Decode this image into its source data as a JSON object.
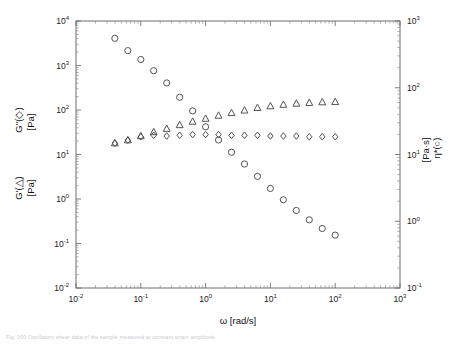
{
  "figure": {
    "caption": "Fig. 000  Oscillatory shear data of the sample measured at constant strain amplitude."
  },
  "colors": {
    "frame": "#6f6f6f",
    "marker": "#4a4a4a",
    "text": "#111111"
  },
  "chart_data": {
    "type": "scatter",
    "title": "",
    "xlabel": "ω [rad/s]",
    "xscale": "log",
    "xlim": [
      0.01,
      1000
    ],
    "xticks": [
      "10-2",
      "10-1",
      "100",
      "101",
      "102",
      "103"
    ],
    "xtick_labels": [
      "10",
      "10",
      "10",
      "10",
      "10",
      "10"
    ],
    "xtick_exponents": [
      "-2",
      "-1",
      "0",
      "1",
      "2",
      "3"
    ],
    "ylabel_left_line1": "G''(◇)",
    "ylabel_left_line2": "[Pa]",
    "ylabel_left_line3": "G'(△)",
    "ylabel_left_line4": "[Pa]",
    "yscale_left": "log",
    "ylim_left": [
      0.01,
      10000
    ],
    "ytick_left_exponents": [
      "-2",
      "-1",
      "0",
      "1",
      "2",
      "3",
      "4"
    ],
    "ylabel_right_line1": "η*(○)",
    "ylabel_right_line2": "[Pa·s]",
    "yscale_right": "log",
    "ylim_right": [
      0.1,
      1000
    ],
    "ytick_right_exponents": [
      "-1",
      "0",
      "1",
      "2",
      "3"
    ],
    "grid": false,
    "legend": "inline-in-axis-labels",
    "series": [
      {
        "name": "η*(○)",
        "marker": "circle",
        "axis": "right",
        "unit": "Pa·s",
        "points": [
          {
            "x": 0.0398,
            "y": 550
          },
          {
            "x": 0.0631,
            "y": 360
          },
          {
            "x": 0.1,
            "y": 265
          },
          {
            "x": 0.158,
            "y": 180
          },
          {
            "x": 0.251,
            "y": 118
          },
          {
            "x": 0.398,
            "y": 72
          },
          {
            "x": 0.631,
            "y": 45
          },
          {
            "x": 1.0,
            "y": 26
          },
          {
            "x": 1.585,
            "y": 16.5
          },
          {
            "x": 2.512,
            "y": 10.8
          },
          {
            "x": 3.98,
            "y": 7.2
          },
          {
            "x": 6.31,
            "y": 4.7
          },
          {
            "x": 10.0,
            "y": 3.1
          },
          {
            "x": 15.85,
            "y": 2.1
          },
          {
            "x": 25.12,
            "y": 1.45
          },
          {
            "x": 39.8,
            "y": 1.05
          },
          {
            "x": 63.1,
            "y": 0.78
          },
          {
            "x": 100.0,
            "y": 0.62
          }
        ]
      },
      {
        "name": "G'(△)",
        "marker": "triangle",
        "axis": "left",
        "unit": "Pa",
        "points": [
          {
            "x": 0.0398,
            "y": 18
          },
          {
            "x": 0.0631,
            "y": 21
          },
          {
            "x": 0.1,
            "y": 26
          },
          {
            "x": 0.158,
            "y": 32
          },
          {
            "x": 0.251,
            "y": 38
          },
          {
            "x": 0.398,
            "y": 46
          },
          {
            "x": 0.631,
            "y": 55
          },
          {
            "x": 1.0,
            "y": 64
          },
          {
            "x": 1.585,
            "y": 75
          },
          {
            "x": 2.512,
            "y": 86
          },
          {
            "x": 3.98,
            "y": 98
          },
          {
            "x": 6.31,
            "y": 112
          },
          {
            "x": 10.0,
            "y": 122
          },
          {
            "x": 15.85,
            "y": 132
          },
          {
            "x": 25.12,
            "y": 140
          },
          {
            "x": 39.8,
            "y": 145
          },
          {
            "x": 63.1,
            "y": 150
          },
          {
            "x": 100.0,
            "y": 152
          }
        ]
      },
      {
        "name": "G''(◇)",
        "marker": "diamond",
        "axis": "left",
        "unit": "Pa",
        "points": [
          {
            "x": 0.0398,
            "y": 18
          },
          {
            "x": 0.0631,
            "y": 21
          },
          {
            "x": 0.1,
            "y": 25
          },
          {
            "x": 0.158,
            "y": 27
          },
          {
            "x": 0.251,
            "y": 26
          },
          {
            "x": 0.398,
            "y": 27
          },
          {
            "x": 0.631,
            "y": 28
          },
          {
            "x": 1.0,
            "y": 28
          },
          {
            "x": 1.585,
            "y": 28
          },
          {
            "x": 2.512,
            "y": 27
          },
          {
            "x": 3.98,
            "y": 27
          },
          {
            "x": 6.31,
            "y": 27
          },
          {
            "x": 10.0,
            "y": 26
          },
          {
            "x": 15.85,
            "y": 26
          },
          {
            "x": 25.12,
            "y": 26
          },
          {
            "x": 39.8,
            "y": 25
          },
          {
            "x": 63.1,
            "y": 25
          },
          {
            "x": 100.0,
            "y": 25
          }
        ]
      }
    ]
  }
}
